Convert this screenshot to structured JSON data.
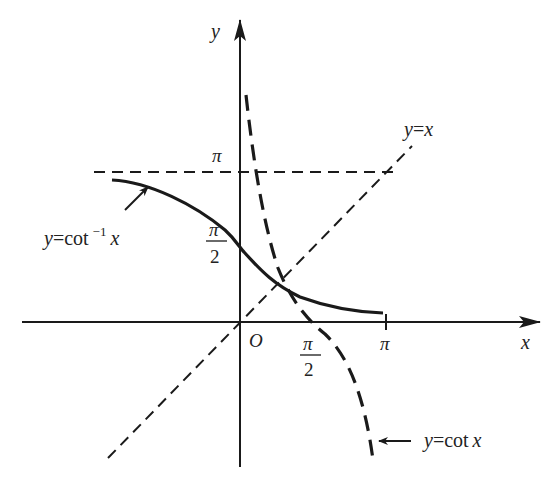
{
  "figure": {
    "axes": {
      "x_label": "x",
      "y_label": "y",
      "origin_label": "O"
    },
    "ticks": {
      "x_half_pi": {
        "num": "π",
        "den": "2"
      },
      "x_pi": "π",
      "y_half_pi": {
        "num": "π",
        "den": "2"
      },
      "y_pi": "π"
    },
    "curves": {
      "arccot": {
        "label_prefix": "y",
        "label_eq": "=",
        "label_fn": "cot",
        "label_sup": "−1",
        "label_var": "x",
        "style": "solid"
      },
      "cot": {
        "label_prefix": "y",
        "label_eq": "=",
        "label_fn": "cot",
        "label_var": "x",
        "style": "dashed"
      },
      "identity": {
        "label_prefix": "y",
        "label_eq": "=",
        "label_var": "x",
        "style": "dashed"
      },
      "asymptote_pi": {
        "style": "dashed"
      }
    },
    "colors": {
      "ink": "#1a1a1a",
      "background": "#ffffff"
    }
  }
}
